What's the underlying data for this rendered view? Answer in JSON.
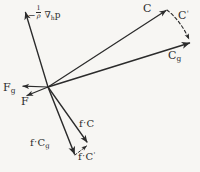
{
  "figure": {
    "background_color": "#f7f6f3",
    "ink_color": "#2b2b2b",
    "width": 200,
    "height": 172,
    "origin": {
      "x": 48,
      "y": 87
    }
  },
  "labels": {
    "pressure_gradient": {
      "text": "-1/p ∇ₕp",
      "minus": "−",
      "numerator": "1",
      "denominator": "ρ",
      "operator": "∇",
      "operator_sub": "h",
      "variable": "p"
    },
    "wind": {
      "text": "C"
    },
    "wind_prime": {
      "text": "C'",
      "base": "C",
      "prime": "'"
    },
    "geostrophic_wind": {
      "text": "Cg",
      "base": "C",
      "sub": "g"
    },
    "friction_geostrophic": {
      "text": "Fg",
      "base": "F",
      "sub": "g"
    },
    "friction": {
      "text": "F"
    },
    "coriolis_wind": {
      "text": "f·C",
      "factor": "f",
      "dot": "·",
      "base": "C"
    },
    "coriolis_geostrophic": {
      "text": "f·Cg",
      "factor": "f",
      "dot": "·",
      "base": "C",
      "sub": "g"
    },
    "coriolis_wind_prime": {
      "text": "f·C'",
      "factor": "f",
      "dot": "·",
      "base": "C",
      "prime": "'"
    }
  },
  "vectors": [
    {
      "name": "pressure-gradient-vector",
      "label": "-1/p ∇ₕp",
      "from": [
        48,
        87
      ],
      "to": [
        25,
        11
      ],
      "style": "solid",
      "head": "arrow"
    },
    {
      "name": "wind-vector",
      "label": "C",
      "from": [
        48,
        87
      ],
      "to": [
        168,
        9
      ],
      "style": "solid",
      "head": "arrow"
    },
    {
      "name": "geostrophic-wind-vector",
      "label": "Cg",
      "from": [
        48,
        87
      ],
      "to": [
        191,
        42
      ],
      "style": "solid",
      "head": "arrow"
    },
    {
      "name": "wind-prime-vector",
      "label": "C'",
      "from": [
        168,
        9
      ],
      "to": [
        190,
        41
      ],
      "style": "dashed",
      "head": "arrow"
    },
    {
      "name": "friction-geostrophic-vector",
      "label": "Fg",
      "from": [
        48,
        87
      ],
      "to": [
        21,
        86
      ],
      "style": "solid",
      "head": "arrow"
    },
    {
      "name": "friction-vector",
      "label": "F",
      "from": [
        48,
        87
      ],
      "to": [
        25,
        96
      ],
      "style": "solid",
      "head": "arrow"
    },
    {
      "name": "coriolis-wind-vector",
      "label": "f·C",
      "from": [
        48,
        87
      ],
      "to": [
        89,
        144
      ],
      "style": "solid",
      "head": "arrow"
    },
    {
      "name": "coriolis-geostrophic-vector",
      "label": "f·Cg",
      "from": [
        48,
        87
      ],
      "to": [
        76,
        157
      ],
      "style": "solid",
      "head": "arrow"
    },
    {
      "name": "coriolis-wind-prime-vector",
      "label": "f·C'",
      "from": [
        76,
        156
      ],
      "to": [
        88,
        145
      ],
      "style": "dashed",
      "head": "arrow"
    }
  ]
}
